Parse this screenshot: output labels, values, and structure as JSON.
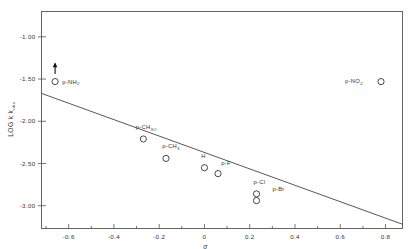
{
  "chart_data": {
    "type": "scatter",
    "title": "",
    "xlabel": "σ",
    "ylabel": "LOG k",
    "ylabel_sub": "obs",
    "xlim": [
      -0.72,
      0.875
    ],
    "ylim": [
      -3.27,
      -0.7
    ],
    "grid": false,
    "legend": "none",
    "xticks": [
      -0.6,
      -0.4,
      -0.2,
      0,
      0.2,
      0.4,
      0.6,
      0.8
    ],
    "xticklabels": [
      "-0.6",
      "-0.4",
      "-0.2",
      "0",
      "0.2",
      "0.4",
      "0.6",
      "0.8"
    ],
    "xminorticks": [
      -0.7,
      -0.5,
      -0.3,
      -0.1,
      0.1,
      0.3,
      0.5,
      0.7
    ],
    "yticks": [
      -1.0,
      -1.5,
      -2.0,
      -2.5,
      -3.0
    ],
    "yticklabels": [
      "-1.00",
      "-1.50",
      "-2.00",
      "-2.50",
      "-3.00"
    ],
    "points": [
      {
        "label": "p-NH",
        "label_sub": "2",
        "x": -0.66,
        "y": -1.53,
        "label_dx": 16,
        "label_dy": 2.0,
        "arrow": true
      },
      {
        "label": "p-CH",
        "label_sub": "3O",
        "x": -0.27,
        "y": -2.21,
        "label_dx": 3,
        "label_dy": -10.0,
        "arrow": false
      },
      {
        "label": "p-CH",
        "label_sub": "3",
        "x": -0.17,
        "y": -2.44,
        "label_dx": 5,
        "label_dy": -10.0,
        "arrow": false
      },
      {
        "label": "H",
        "label_sub": "",
        "x": 0.0,
        "y": -2.55,
        "label_dx": -1,
        "label_dy": -9.5,
        "arrow": false
      },
      {
        "label": "p-F",
        "label_sub": "",
        "x": 0.06,
        "y": -2.62,
        "label_dx": 8,
        "label_dy": -9.0,
        "arrow": false
      },
      {
        "label": "p-Cl",
        "label_sub": "",
        "x": 0.23,
        "y": -2.86,
        "label_dx": 3,
        "label_dy": -9.5,
        "arrow": false
      },
      {
        "label": "p-Br",
        "label_sub": "",
        "x": 0.23,
        "y": -2.94,
        "label_dx": 22,
        "label_dy": -9.5,
        "arrow": false
      },
      {
        "label": "p-NO",
        "label_sub": "2",
        "x": 0.78,
        "y": -1.53,
        "label_dx": -27,
        "label_dy": 1.5,
        "arrow": false
      }
    ],
    "fit_line": {
      "x1": -0.72,
      "y1": -1.67,
      "x2": 0.875,
      "y2": -3.22
    },
    "colors": {
      "axis": "#555555",
      "marker": "#333333",
      "line": "#444444",
      "text": "#333333",
      "background": "#ffffff"
    }
  }
}
